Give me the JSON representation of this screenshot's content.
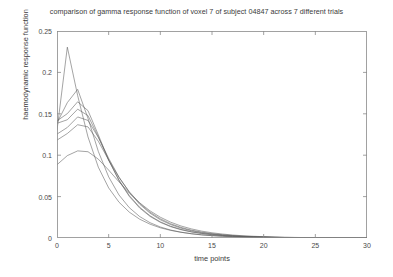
{
  "chart_data": {
    "type": "line",
    "title": "comparison of gamma response function of voxel 7 of subject 04847 across 7 different trials",
    "xlabel": "time points",
    "ylabel": "haemodynamic response function",
    "xlim": [
      0,
      30
    ],
    "ylim": [
      0,
      0.25
    ],
    "xticks": [
      0,
      5,
      10,
      15,
      20,
      25,
      30
    ],
    "yticks": [
      0,
      0.05,
      0.1,
      0.15,
      0.2,
      0.25
    ],
    "xtick_labels": [
      "0",
      "5",
      "10",
      "15",
      "20",
      "25",
      "30"
    ],
    "ytick_labels": [
      "0",
      "0.05",
      "0.1",
      "0.15",
      "0.2",
      "0.25"
    ],
    "grid": false,
    "legend": "none",
    "line_color": "#5a5a5a",
    "x": [
      0,
      1,
      2,
      3,
      4,
      5,
      6,
      7,
      8,
      9,
      10,
      11,
      12,
      13,
      14,
      15,
      16,
      17,
      18,
      19,
      20,
      21,
      22,
      23,
      24,
      25,
      26,
      27,
      28,
      29,
      30
    ],
    "series": [
      {
        "name": "trial 1",
        "values": [
          0.13,
          0.2305,
          0.172,
          0.122,
          0.0855,
          0.0605,
          0.0432,
          0.0312,
          0.0227,
          0.0167,
          0.0123,
          0.0092,
          0.0069,
          0.0052,
          0.0039,
          0.003,
          0.0023,
          0.0017,
          0.0013,
          0.001,
          0.0008,
          0.0006,
          0.0004,
          0.0003,
          0.0003,
          0.0002,
          0.0001,
          0.0001,
          0.0001,
          0.0001,
          0.0
        ]
      },
      {
        "name": "trial 2",
        "values": [
          0.139,
          0.1635,
          0.1795,
          0.1445,
          0.1045,
          0.0738,
          0.0519,
          0.0366,
          0.0259,
          0.0185,
          0.0133,
          0.0096,
          0.007,
          0.0051,
          0.0037,
          0.0028,
          0.002,
          0.0015,
          0.0011,
          0.0008,
          0.0006,
          0.0005,
          0.0003,
          0.0003,
          0.0002,
          0.0001,
          0.0001,
          0.0001,
          0.0001,
          0.0,
          0.0
        ]
      },
      {
        "name": "trial 3",
        "values": [
          0.1415,
          0.1502,
          0.1645,
          0.1538,
          0.1245,
          0.0942,
          0.0692,
          0.0502,
          0.0362,
          0.0261,
          0.0189,
          0.0137,
          0.01,
          0.0073,
          0.0054,
          0.004,
          0.003,
          0.0022,
          0.0016,
          0.0012,
          0.0009,
          0.0007,
          0.0005,
          0.0004,
          0.0003,
          0.0002,
          0.0002,
          0.0001,
          0.0001,
          0.0001,
          0.0
        ]
      },
      {
        "name": "trial 4",
        "values": [
          0.1385,
          0.1428,
          0.1556,
          0.1478,
          0.1222,
          0.094,
          0.07,
          0.0512,
          0.0372,
          0.0269,
          0.0195,
          0.0142,
          0.0104,
          0.0076,
          0.0056,
          0.0042,
          0.0031,
          0.0023,
          0.0017,
          0.0013,
          0.001,
          0.0007,
          0.0006,
          0.0004,
          0.0003,
          0.0002,
          0.0002,
          0.0001,
          0.0001,
          0.0001,
          0.0
        ]
      },
      {
        "name": "trial 5",
        "values": [
          0.1255,
          0.1335,
          0.1462,
          0.142,
          0.1215,
          0.0962,
          0.0735,
          0.0551,
          0.0408,
          0.03,
          0.022,
          0.0162,
          0.0119,
          0.0088,
          0.0065,
          0.0048,
          0.0036,
          0.0027,
          0.002,
          0.0015,
          0.0011,
          0.0008,
          0.0006,
          0.0005,
          0.0004,
          0.0003,
          0.0002,
          0.0002,
          0.0001,
          0.0001,
          0.0
        ]
      },
      {
        "name": "trial 6",
        "values": [
          0.1182,
          0.1262,
          0.1368,
          0.1342,
          0.1168,
          0.0942,
          0.0732,
          0.0558,
          0.0419,
          0.0312,
          0.0232,
          0.0172,
          0.0128,
          0.0095,
          0.0071,
          0.0053,
          0.004,
          0.003,
          0.0022,
          0.0017,
          0.0013,
          0.001,
          0.0007,
          0.0006,
          0.0004,
          0.0003,
          0.0002,
          0.0002,
          0.0001,
          0.0001,
          0.0
        ]
      },
      {
        "name": "trial 7",
        "values": [
          0.0885,
          0.0995,
          0.1052,
          0.1042,
          0.0952,
          0.082,
          0.0678,
          0.0542,
          0.0425,
          0.0328,
          0.0251,
          0.0191,
          0.0145,
          0.011,
          0.0083,
          0.0063,
          0.0048,
          0.0036,
          0.0027,
          0.0021,
          0.0016,
          0.0012,
          0.0009,
          0.0007,
          0.0005,
          0.0004,
          0.0003,
          0.0002,
          0.0002,
          0.0001,
          0.0
        ]
      }
    ]
  }
}
